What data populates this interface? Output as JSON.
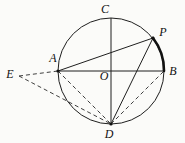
{
  "figure": {
    "type": "geometry-diagram",
    "colors": {
      "line": "#1f1f1f",
      "background": "#fbfbf9",
      "label": "#111111"
    },
    "points": {
      "A": {
        "label": "A",
        "on_circle": true
      },
      "B": {
        "label": "B",
        "on_circle": true
      },
      "C": {
        "label": "C",
        "on_circle": true
      },
      "D": {
        "label": "D",
        "on_circle": true
      },
      "E": {
        "label": "E",
        "on_circle": false
      },
      "O": {
        "label": "O",
        "on_circle": false
      },
      "P": {
        "label": "P",
        "on_circle": true
      }
    },
    "segments": {
      "solid": [
        "A-B",
        "C-D",
        "A-P",
        "D-P"
      ],
      "dashed": [
        "E-A",
        "E-D",
        "A-D",
        "D-B"
      ],
      "bold_arc": "P-B"
    },
    "dots_at": [
      "A",
      "D",
      "P"
    ]
  }
}
